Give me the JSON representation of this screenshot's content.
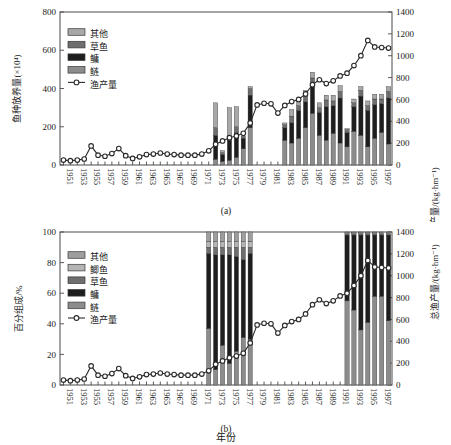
{
  "figure": {
    "xlabel": "年份",
    "panel_a_label": "(a)",
    "panel_b_label": "(b)"
  },
  "chart_data": [
    {
      "id": "panel-a",
      "type": "bar",
      "title": "",
      "subtitle": "(a)",
      "xlabel": "年份",
      "ylabel": "鱼种放养量(×10⁴)",
      "y2label": "总渔产量/(kg·hm⁻¹)",
      "ylim": [
        0,
        800
      ],
      "yticks": [
        0,
        200,
        400,
        600,
        800
      ],
      "y2lim": [
        0,
        1400
      ],
      "y2ticks": [
        0,
        200,
        400,
        600,
        800,
        1000,
        1200,
        1400
      ],
      "grid": false,
      "legend_position": "upper-left",
      "stacked": true,
      "x": [
        1951,
        1952,
        1953,
        1954,
        1955,
        1956,
        1957,
        1958,
        1959,
        1960,
        1961,
        1962,
        1963,
        1964,
        1965,
        1966,
        1967,
        1968,
        1969,
        1970,
        1971,
        1972,
        1973,
        1974,
        1975,
        1976,
        1977,
        1978,
        1979,
        1980,
        1981,
        1982,
        1983,
        1984,
        1985,
        1986,
        1987,
        1988,
        1989,
        1990,
        1991,
        1992,
        1993,
        1994,
        1995,
        1996,
        1997,
        1998
      ],
      "tick_labels": [
        "1951",
        "1953",
        "1955",
        "1957",
        "1959",
        "1961",
        "1963",
        "1965",
        "1967",
        "1969",
        "1971",
        "1973",
        "1975",
        "1977",
        "1979",
        "1981",
        "1983",
        "1985",
        "1987",
        "1989",
        "1991",
        "1993",
        "1995",
        "1997"
      ],
      "series": [
        {
          "name": "鲢",
          "color": "#8c8c8c",
          "values": [
            0,
            0,
            0,
            0,
            0,
            0,
            0,
            0,
            0,
            0,
            0,
            0,
            0,
            0,
            0,
            0,
            0,
            0,
            0,
            0,
            0,
            0,
            30,
            20,
            25,
            40,
            85,
            195,
            0,
            0,
            0,
            0,
            130,
            115,
            140,
            195,
            270,
            155,
            130,
            165,
            115,
            95,
            175,
            155,
            95,
            140,
            170,
            110
          ]
        },
        {
          "name": "鳙",
          "color": "#1e1e1e",
          "values": [
            0,
            0,
            0,
            0,
            0,
            0,
            0,
            0,
            0,
            0,
            0,
            0,
            0,
            0,
            0,
            0,
            0,
            0,
            0,
            0,
            0,
            0,
            125,
            35,
            105,
            130,
            55,
            170,
            0,
            0,
            0,
            0,
            65,
            105,
            145,
            135,
            145,
            120,
            175,
            145,
            235,
            75,
            130,
            205,
            190,
            175,
            150,
            240
          ]
        },
        {
          "name": "草鱼",
          "color": "#6e6e6e",
          "values": [
            0,
            0,
            0,
            0,
            0,
            0,
            0,
            0,
            0,
            0,
            0,
            0,
            0,
            0,
            0,
            0,
            0,
            0,
            0,
            0,
            0,
            0,
            40,
            10,
            25,
            30,
            10,
            35,
            0,
            0,
            0,
            0,
            15,
            35,
            25,
            30,
            40,
            25,
            35,
            25,
            35,
            15,
            20,
            30,
            25,
            30,
            25,
            35
          ]
        },
        {
          "name": "其他",
          "color": "#a8a8a8",
          "values": [
            0,
            0,
            0,
            0,
            0,
            0,
            0,
            0,
            0,
            0,
            0,
            0,
            0,
            0,
            0,
            0,
            0,
            0,
            0,
            0,
            0,
            0,
            130,
            10,
            145,
            105,
            0,
            10,
            0,
            0,
            0,
            0,
            10,
            35,
            25,
            30,
            30,
            25,
            25,
            30,
            30,
            5,
            20,
            20,
            25,
            25,
            25,
            25
          ]
        }
      ],
      "line_series": {
        "name": "渔产量",
        "axis": "right",
        "marker": "open-circle",
        "values": [
          45,
          40,
          45,
          55,
          175,
          90,
          80,
          105,
          150,
          85,
          60,
          75,
          95,
          100,
          110,
          100,
          95,
          90,
          90,
          90,
          100,
          130,
          190,
          220,
          250,
          265,
          290,
          385,
          550,
          565,
          560,
          475,
          545,
          580,
          600,
          650,
          735,
          780,
          745,
          770,
          815,
          840,
          910,
          1000,
          1140,
          1080,
          1075,
          1070
        ]
      }
    },
    {
      "id": "panel-b",
      "type": "bar",
      "title": "",
      "subtitle": "(b)",
      "xlabel": "年份",
      "ylabel": "百分组成/%",
      "y2label": "总渔产量/(kg·hm⁻¹)",
      "ylim": [
        0,
        100
      ],
      "yticks": [
        0,
        20,
        40,
        60,
        80,
        100
      ],
      "y2lim": [
        0,
        1400
      ],
      "y2ticks": [
        0,
        200,
        400,
        600,
        800,
        1000,
        1200,
        1400
      ],
      "grid": false,
      "legend_position": "upper-left",
      "stacked": true,
      "stacked_percent": true,
      "x": [
        1951,
        1952,
        1953,
        1954,
        1955,
        1956,
        1957,
        1958,
        1959,
        1960,
        1961,
        1962,
        1963,
        1964,
        1965,
        1966,
        1967,
        1968,
        1969,
        1970,
        1971,
        1972,
        1973,
        1974,
        1975,
        1976,
        1977,
        1978,
        1979,
        1980,
        1981,
        1982,
        1983,
        1984,
        1985,
        1986,
        1987,
        1988,
        1989,
        1990,
        1991,
        1992,
        1993,
        1994,
        1995,
        1996,
        1997,
        1998
      ],
      "tick_labels": [
        "1951",
        "1953",
        "1955",
        "1957",
        "1959",
        "1961",
        "1963",
        "1965",
        "1967",
        "1969",
        "1971",
        "1973",
        "1975",
        "1977",
        "1979",
        "1981",
        "1983",
        "1985",
        "1987",
        "1989",
        "1991",
        "1993",
        "1995",
        "1997"
      ],
      "bar_years": [
        1972,
        1973,
        1974,
        1975,
        1976,
        1977,
        1978,
        1992,
        1993,
        1994,
        1995,
        1996,
        1997,
        1998
      ],
      "series": [
        {
          "name": "鲢",
          "color": "#8c8c8c",
          "values": [
            0,
            0,
            0,
            0,
            0,
            0,
            0,
            0,
            0,
            0,
            0,
            0,
            0,
            0,
            0,
            0,
            0,
            0,
            0,
            0,
            0,
            37,
            10,
            26,
            14,
            22,
            31,
            30,
            0,
            0,
            0,
            0,
            0,
            0,
            0,
            0,
            0,
            0,
            0,
            0,
            0,
            55,
            49,
            36,
            41,
            58,
            58,
            42
          ]
        },
        {
          "name": "鳙",
          "color": "#1e1e1e",
          "values": [
            0,
            0,
            0,
            0,
            0,
            0,
            0,
            0,
            0,
            0,
            0,
            0,
            0,
            0,
            0,
            0,
            0,
            0,
            0,
            0,
            0,
            49,
            75,
            59,
            71,
            62,
            51,
            56,
            0,
            0,
            0,
            0,
            0,
            0,
            0,
            0,
            0,
            0,
            0,
            0,
            0,
            43,
            49,
            62,
            57,
            40,
            40,
            56
          ]
        },
        {
          "name": "草鱼",
          "color": "#6e6e6e",
          "values": [
            0,
            0,
            0,
            0,
            0,
            0,
            0,
            0,
            0,
            0,
            0,
            0,
            0,
            0,
            0,
            0,
            0,
            0,
            0,
            0,
            0,
            4,
            5,
            5,
            5,
            6,
            8,
            4,
            0,
            0,
            0,
            0,
            0,
            0,
            0,
            0,
            0,
            0,
            0,
            0,
            0,
            1,
            1,
            1,
            1,
            1,
            1,
            1
          ]
        },
        {
          "name": "鲫鱼",
          "color": "#b4b4b4",
          "values": [
            0,
            0,
            0,
            0,
            0,
            0,
            0,
            0,
            0,
            0,
            0,
            0,
            0,
            0,
            0,
            0,
            0,
            0,
            0,
            0,
            0,
            4,
            4,
            4,
            4,
            4,
            4,
            4,
            0,
            0,
            0,
            0,
            0,
            0,
            0,
            0,
            0,
            0,
            0,
            0,
            0,
            0.5,
            0.5,
            0.5,
            0.5,
            0.5,
            0.5,
            0.5
          ]
        },
        {
          "name": "其他",
          "color": "#9e9e9e",
          "values": [
            0,
            0,
            0,
            0,
            0,
            0,
            0,
            0,
            0,
            0,
            0,
            0,
            0,
            0,
            0,
            0,
            0,
            0,
            0,
            0,
            0,
            6,
            6,
            6,
            6,
            6,
            6,
            6,
            0,
            0,
            0,
            0,
            0,
            0,
            0,
            0,
            0,
            0,
            0,
            0,
            0,
            0.5,
            0.5,
            0.5,
            0.5,
            0.5,
            0.5,
            0.5
          ]
        }
      ],
      "line_series": {
        "name": "渔产量",
        "axis": "right",
        "marker": "open-circle",
        "values": [
          45,
          40,
          45,
          55,
          175,
          90,
          80,
          105,
          150,
          85,
          60,
          75,
          95,
          100,
          110,
          100,
          95,
          90,
          90,
          90,
          100,
          130,
          190,
          220,
          250,
          265,
          290,
          385,
          550,
          565,
          560,
          475,
          545,
          580,
          600,
          650,
          735,
          780,
          745,
          770,
          815,
          840,
          910,
          1000,
          1140,
          1080,
          1075,
          1070
        ]
      }
    }
  ],
  "panel_a": {
    "label": "(a)",
    "ylabel": "鱼种放养量(×10⁴)",
    "y2label": "总渔产量/(kg·hm⁻¹)",
    "legend": [
      {
        "label": "其他",
        "color": "#a8a8a8",
        "kind": "swatch"
      },
      {
        "label": "草鱼",
        "color": "#6e6e6e",
        "kind": "swatch"
      },
      {
        "label": "鳙",
        "color": "#1e1e1e",
        "kind": "swatch"
      },
      {
        "label": "鲢",
        "color": "#8c8c8c",
        "kind": "swatch"
      },
      {
        "label": "渔产量",
        "color": "#2b2b2b",
        "kind": "line-marker"
      }
    ]
  },
  "panel_b": {
    "label": "(b)",
    "ylabel": "百分组成/%",
    "y2label": "总渔产量/(kg·hm⁻¹)",
    "legend": [
      {
        "label": "其他",
        "color": "#9e9e9e",
        "kind": "swatch"
      },
      {
        "label": "鲫鱼",
        "color": "#b4b4b4",
        "kind": "swatch"
      },
      {
        "label": "草鱼",
        "color": "#6e6e6e",
        "kind": "swatch"
      },
      {
        "label": "鳙",
        "color": "#1e1e1e",
        "kind": "swatch"
      },
      {
        "label": "鲢",
        "color": "#8c8c8c",
        "kind": "swatch"
      },
      {
        "label": "渔产量",
        "color": "#2b2b2b",
        "kind": "line-marker"
      }
    ]
  }
}
